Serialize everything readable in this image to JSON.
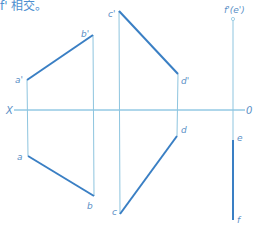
{
  "caption": "f' 相交。",
  "colors": {
    "thin_line": "#8ec5df",
    "thick_line": "#3a7fc4",
    "axis": "#5eaed6",
    "label": "#5b8fc6"
  },
  "axis": {
    "left_label": "X",
    "right_label": "0"
  },
  "points": {
    "a_prime": {
      "label": "a'",
      "x": 27,
      "y": 80
    },
    "b_prime": {
      "label": "b'",
      "x": 93,
      "y": 35
    },
    "c_prime": {
      "label": "c'",
      "x": 119,
      "y": 11
    },
    "d_prime": {
      "label": "d'",
      "x": 178,
      "y": 74
    },
    "a": {
      "label": "a",
      "x": 28,
      "y": 156
    },
    "b": {
      "label": "b",
      "x": 94,
      "y": 196
    },
    "c": {
      "label": "c",
      "x": 120,
      "y": 214
    },
    "d": {
      "label": "d",
      "x": 177,
      "y": 136
    },
    "f_prime_e_prime": {
      "label": "f'(e')",
      "x": 233,
      "y": 18
    },
    "e": {
      "label": "e",
      "x": 233,
      "y": 140
    },
    "f": {
      "label": "f",
      "x": 233,
      "y": 220
    }
  }
}
